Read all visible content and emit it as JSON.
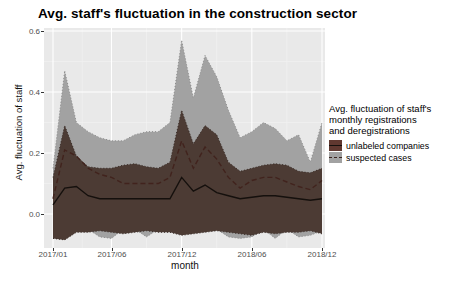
{
  "title": "Avg. staff's fluctuation in the construction sector",
  "colors": {
    "panel_bg": "#e9e9e9",
    "grid_major": "#ffffff",
    "grid_minor": "#f2f2f2",
    "suspected_fill": "#a2a2a2",
    "suspected_edge": "#8b8b8b",
    "unlabeled_fill": "#4c3b34",
    "unlabeled_edge": "#362a25",
    "solid_line": "#15100d",
    "dashed_line": "#41231d",
    "tick_text": "#4d4d4d",
    "legend_unlabeled_swatch": "#603830",
    "legend_suspected_swatch": "#a2a2a2"
  },
  "legend": {
    "title_lines": [
      "Avg. fluctuation of staff's",
      "monthly registrations",
      "and deregistrations"
    ],
    "items": [
      {
        "label": "unlabeled companies",
        "swatch": "#603830",
        "line_style": "solid"
      },
      {
        "label": "suspected cases",
        "swatch": "#a2a2a2",
        "line_style": "dashed"
      }
    ]
  },
  "chart_data": {
    "type": "area",
    "title": "Avg. staff's fluctuation in the construction sector",
    "xlabel": "month",
    "ylabel": "Avg. fluctuation of staff",
    "ylim": [
      -0.11,
      0.61
    ],
    "yticks": [
      0.0,
      0.2,
      0.4,
      0.6
    ],
    "ytick_labels_top_to_bottom": [
      "0.6",
      "0.4",
      "0.2",
      "0.0"
    ],
    "xticks": [
      "2017/01",
      "2017/06",
      "2017/12",
      "2018/06",
      "2018/12"
    ],
    "xtick_month_indices": [
      0,
      5,
      11,
      17,
      23
    ],
    "x": [
      "2017/01",
      "2017/02",
      "2017/03",
      "2017/04",
      "2017/05",
      "2017/06",
      "2017/07",
      "2017/08",
      "2017/09",
      "2017/10",
      "2017/11",
      "2017/12",
      "2018/01",
      "2018/02",
      "2018/03",
      "2018/04",
      "2018/05",
      "2018/06",
      "2018/07",
      "2018/08",
      "2018/09",
      "2018/10",
      "2018/11",
      "2018/12"
    ],
    "legend_position": "right",
    "grid": true,
    "series": [
      {
        "name": "suspected cases band",
        "kind": "ribbon",
        "upper": [
          0.15,
          0.47,
          0.3,
          0.27,
          0.25,
          0.24,
          0.24,
          0.26,
          0.27,
          0.27,
          0.3,
          0.57,
          0.38,
          0.52,
          0.45,
          0.34,
          0.25,
          0.27,
          0.3,
          0.28,
          0.24,
          0.26,
          0.17,
          0.3
        ],
        "lower": [
          -0.05,
          -0.06,
          -0.05,
          -0.05,
          -0.075,
          -0.08,
          -0.05,
          -0.05,
          -0.075,
          -0.05,
          -0.05,
          -0.055,
          -0.05,
          -0.05,
          -0.05,
          -0.075,
          -0.08,
          -0.075,
          -0.05,
          -0.08,
          -0.05,
          -0.075,
          -0.07,
          -0.055
        ]
      },
      {
        "name": "unlabeled companies band",
        "kind": "ribbon",
        "upper": [
          0.12,
          0.29,
          0.19,
          0.155,
          0.15,
          0.15,
          0.16,
          0.165,
          0.155,
          0.15,
          0.17,
          0.34,
          0.23,
          0.29,
          0.26,
          0.17,
          0.14,
          0.15,
          0.16,
          0.165,
          0.16,
          0.14,
          0.135,
          0.15
        ],
        "lower": [
          -0.08,
          -0.085,
          -0.06,
          -0.06,
          -0.055,
          -0.06,
          -0.065,
          -0.06,
          -0.055,
          -0.06,
          -0.06,
          -0.07,
          -0.065,
          -0.06,
          -0.055,
          -0.06,
          -0.065,
          -0.07,
          -0.06,
          -0.065,
          -0.06,
          -0.06,
          -0.055,
          -0.065
        ]
      },
      {
        "name": "suspected cases mean",
        "kind": "line",
        "style": "dashed",
        "values": [
          0.05,
          0.21,
          0.19,
          0.15,
          0.13,
          0.12,
          0.1,
          0.1,
          0.1,
          0.1,
          0.12,
          0.24,
          0.15,
          0.22,
          0.18,
          0.12,
          0.085,
          0.11,
          0.12,
          0.12,
          0.105,
          0.09,
          0.08,
          0.11
        ]
      },
      {
        "name": "unlabeled companies mean",
        "kind": "line",
        "style": "solid",
        "values": [
          0.03,
          0.085,
          0.09,
          0.06,
          0.05,
          0.05,
          0.05,
          0.05,
          0.05,
          0.05,
          0.05,
          0.12,
          0.075,
          0.095,
          0.07,
          0.06,
          0.05,
          0.055,
          0.06,
          0.06,
          0.055,
          0.05,
          0.045,
          0.05
        ]
      }
    ]
  }
}
